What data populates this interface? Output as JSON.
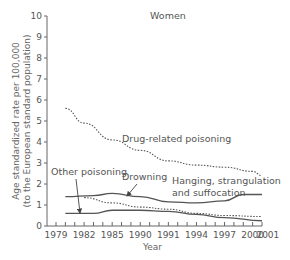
{
  "chart_data": {
    "type": "line",
    "title": "Women",
    "xlabel": "Year",
    "ylabel": "Age standardized rate per 100,000 (to the European standard population)",
    "ylabel_lines": [
      "Age standardized rate per 100,000",
      "(to the European standard population)"
    ],
    "xlim": [
      1979,
      2001
    ],
    "ylim": [
      0,
      10
    ],
    "x_ticks": [
      1979,
      1982,
      1985,
      1990,
      1991,
      1994,
      1997,
      2000,
      2001
    ],
    "y_ticks": [
      0,
      1,
      2,
      3,
      4,
      5,
      6,
      7,
      8,
      9,
      10
    ],
    "grid": false,
    "legend": "inline annotations",
    "series": [
      {
        "name": "Drug-related poisoning",
        "style": "dotted",
        "x": [
          1980,
          1982,
          1985,
          1988,
          1991,
          1994,
          1997,
          2000,
          2001
        ],
        "values": [
          5.6,
          4.9,
          4.1,
          3.6,
          3.1,
          2.9,
          2.8,
          2.6,
          2.4
        ]
      },
      {
        "name": "Hanging, strangulation and suffocation",
        "style": "solid",
        "x": [
          1980,
          1983,
          1985,
          1988,
          1991,
          1994,
          1997,
          1999,
          2001
        ],
        "values": [
          1.4,
          1.45,
          1.55,
          1.4,
          1.15,
          1.1,
          1.2,
          1.5,
          1.5
        ]
      },
      {
        "name": "Other poisoning",
        "style": "dotted",
        "x": [
          1982,
          1985,
          1988,
          1991,
          1994,
          1997,
          2001
        ],
        "values": [
          1.35,
          1.1,
          0.9,
          0.8,
          0.6,
          0.5,
          0.45
        ]
      },
      {
        "name": "Drowning",
        "style": "solid",
        "x": [
          1980,
          1983,
          1985,
          1988,
          1991,
          1994,
          1997,
          2001
        ],
        "values": [
          0.6,
          0.6,
          0.75,
          0.75,
          0.7,
          0.55,
          0.4,
          0.25
        ]
      }
    ],
    "annotations": [
      {
        "text": "Drug-related poisoning"
      },
      {
        "text": "Drowning"
      },
      {
        "text": "Other poisoning"
      },
      {
        "text": "Hanging, strangulation"
      },
      {
        "text": "and suffocation"
      }
    ]
  },
  "colors": {
    "line": "#555555",
    "axis": "#666666",
    "text": "#555555"
  }
}
